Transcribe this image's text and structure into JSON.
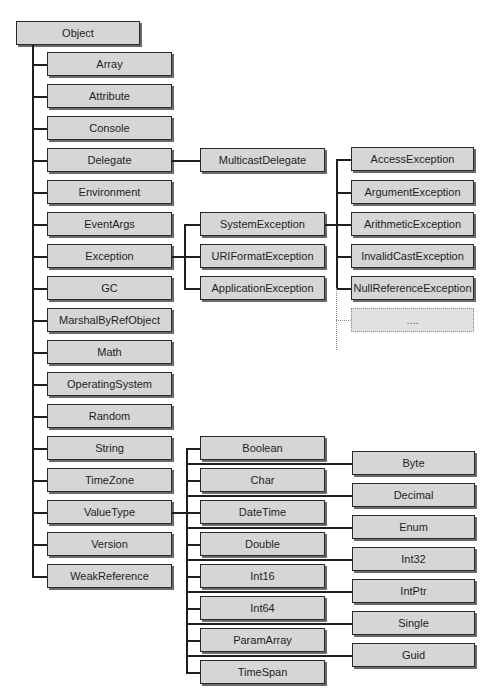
{
  "diagram": {
    "root": {
      "label": "Object",
      "x": 16,
      "y": 21,
      "w": 124
    },
    "object_children": [
      {
        "label": "Array",
        "y": 52
      },
      {
        "label": "Attribute",
        "y": 84
      },
      {
        "label": "Console",
        "y": 116
      },
      {
        "label": "Delegate",
        "y": 148
      },
      {
        "label": "Environment",
        "y": 180
      },
      {
        "label": "EventArgs",
        "y": 212
      },
      {
        "label": "Exception",
        "y": 244
      },
      {
        "label": "GC",
        "y": 276
      },
      {
        "label": "MarshalByRefObject",
        "y": 308
      },
      {
        "label": "Math",
        "y": 340
      },
      {
        "label": "OperatingSystem",
        "y": 372
      },
      {
        "label": "Random",
        "y": 404
      },
      {
        "label": "String",
        "y": 436
      },
      {
        "label": "TimeZone",
        "y": 468
      },
      {
        "label": "ValueType",
        "y": 500
      },
      {
        "label": "Version",
        "y": 532
      },
      {
        "label": "WeakReference",
        "y": 564
      }
    ],
    "delegate_children": [
      {
        "label": "MulticastDelegate",
        "y": 148
      }
    ],
    "exception_children": [
      {
        "label": "SystemException",
        "y": 212
      },
      {
        "label": "URIFormatException",
        "y": 244
      },
      {
        "label": "ApplicationException",
        "y": 276
      }
    ],
    "system_exception_children": [
      {
        "label": "AccessException",
        "y": 147
      },
      {
        "label": "ArgumentException",
        "y": 180
      },
      {
        "label": "ArithmeticException",
        "y": 212
      },
      {
        "label": "InvalidCastException",
        "y": 244
      },
      {
        "label": "NullReferenceException",
        "y": 276
      },
      {
        "label": "....",
        "y": 308,
        "dotted": true
      }
    ],
    "valuetype_children_middle": [
      {
        "label": "Boolean",
        "y": 436
      },
      {
        "label": "Char",
        "y": 468
      },
      {
        "label": "DateTime",
        "y": 500
      },
      {
        "label": "Double",
        "y": 532
      },
      {
        "label": "Int16",
        "y": 564
      },
      {
        "label": "Int64",
        "y": 596
      },
      {
        "label": "ParamArray",
        "y": 628
      },
      {
        "label": "TimeSpan",
        "y": 660
      }
    ],
    "valuetype_children_right": [
      {
        "label": "Byte",
        "y": 451
      },
      {
        "label": "Decimal",
        "y": 483
      },
      {
        "label": "Enum",
        "y": 515
      },
      {
        "label": "Int32",
        "y": 547
      },
      {
        "label": "IntPtr",
        "y": 579
      },
      {
        "label": "Single",
        "y": 611
      },
      {
        "label": "Guid",
        "y": 643
      }
    ],
    "colors": {
      "box_fill": "#d6d6d6",
      "box_border": "#2a2a2a",
      "shadow": "#6a6a6a",
      "line": "#1e1e1e",
      "dotted": "#8a8a8a"
    }
  }
}
